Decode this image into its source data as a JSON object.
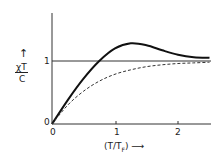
{
  "chart_data": {
    "type": "line",
    "title": "",
    "xlabel": "(T/T_F)",
    "ylabel": "χT/C",
    "x_ticks": [
      "0",
      "1",
      "2"
    ],
    "y_ticks": [
      "0",
      "1"
    ],
    "xlim": [
      0,
      2.5
    ],
    "ylim": [
      0,
      1.75
    ],
    "grid": false,
    "reference_line": {
      "y": 1,
      "style": "solid thin"
    },
    "series": [
      {
        "name": "solid",
        "style": "solid",
        "x": [
          0,
          0.25,
          0.5,
          0.75,
          1.0,
          1.25,
          1.5,
          1.75,
          2.0,
          2.25,
          2.5
        ],
        "y": [
          0,
          0.38,
          0.72,
          1.0,
          1.2,
          1.28,
          1.25,
          1.17,
          1.1,
          1.06,
          1.05
        ]
      },
      {
        "name": "dashed",
        "style": "dashed",
        "x": [
          0,
          0.25,
          0.5,
          0.75,
          1.0,
          1.25,
          1.5,
          1.75,
          2.0,
          2.25,
          2.5
        ],
        "y": [
          0,
          0.3,
          0.52,
          0.68,
          0.79,
          0.86,
          0.91,
          0.94,
          0.96,
          0.97,
          0.98
        ]
      }
    ]
  },
  "labels": {
    "y_axis_num": "χT",
    "y_axis_den": "C",
    "y_arrow": "↑",
    "x_axis": "(T/T",
    "x_sub": "F",
    "x_close": ")",
    "x_arrow": "⟶",
    "tick_x0": "0",
    "tick_x1": "1",
    "tick_x2": "2",
    "tick_y0": "0",
    "tick_y1": "1"
  }
}
